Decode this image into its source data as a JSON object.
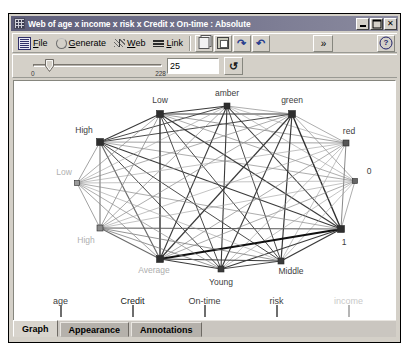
{
  "window": {
    "title": "Web of age x income x risk x Credit x On-time : Absolute",
    "icon_name": "web-graph-icon",
    "minimize_label": "_",
    "maximize_label": "□",
    "close_label": "✕"
  },
  "toolbar": {
    "menus": [
      {
        "label": "File",
        "mnemonic": "F",
        "icon": "file-icon"
      },
      {
        "label": "Generate",
        "mnemonic": "G",
        "icon": "generate-icon"
      },
      {
        "label": "Web",
        "mnemonic": "W",
        "icon": "web-icon"
      },
      {
        "label": "Link",
        "mnemonic": "L",
        "icon": "link-icon"
      }
    ],
    "buttons": [
      {
        "name": "copy-button",
        "icon": "copy-icon",
        "label": ""
      },
      {
        "name": "paste-button",
        "icon": "paste-icon",
        "label": ""
      },
      {
        "name": "redo-button",
        "icon": "redo-icon",
        "label": "↷"
      },
      {
        "name": "undo-button",
        "icon": "undo-icon",
        "label": "↶"
      }
    ],
    "overflow_label": "»",
    "help_label": "?"
  },
  "slider": {
    "min_label": "0",
    "max_label": "228",
    "value": "25",
    "thumb_position_pct": 11,
    "refresh_label": "↺",
    "refresh_name": "refresh-button"
  },
  "plot": {
    "nodes": [
      {
        "id": "n0",
        "label": "High",
        "x": 86,
        "y": 61,
        "size": 7,
        "color": "#2e2e2e",
        "label_dx": -16,
        "label_dy": -9,
        "label_color": "#3d3d3d",
        "anchor": "middle"
      },
      {
        "id": "n1",
        "label": "Low",
        "x": 146,
        "y": 33,
        "size": 7,
        "color": "#2e2e2e",
        "label_dx": 0,
        "label_dy": -11,
        "label_color": "#3d3d3d",
        "anchor": "middle"
      },
      {
        "id": "n2",
        "label": "amber",
        "x": 213,
        "y": 25,
        "size": 6,
        "color": "#2e2e2e",
        "label_dx": 0,
        "label_dy": -10,
        "label_color": "#3d3d3d",
        "anchor": "middle"
      },
      {
        "id": "n3",
        "label": "green",
        "x": 278,
        "y": 33,
        "size": 7,
        "color": "#2e2e2e",
        "label_dx": 0,
        "label_dy": -11,
        "label_color": "#3d3d3d",
        "anchor": "middle"
      },
      {
        "id": "n4",
        "label": "red",
        "x": 332,
        "y": 62,
        "size": 6,
        "color": "#555555",
        "label_dx": 3,
        "label_dy": -9,
        "label_color": "#3d3d3d",
        "anchor": "middle"
      },
      {
        "id": "n5",
        "label": "0",
        "x": 341,
        "y": 100,
        "size": 5,
        "color": "#666666",
        "label_dx": 14,
        "label_dy": -7,
        "label_color": "#3d3d3d",
        "anchor": "middle"
      },
      {
        "id": "n6",
        "label": "1",
        "x": 327,
        "y": 148,
        "size": 7,
        "color": "#2e2e2e",
        "label_dx": 3,
        "label_dy": 16,
        "label_color": "#3d3d3d",
        "anchor": "middle"
      },
      {
        "id": "n7",
        "label": "Middle",
        "x": 267,
        "y": 180,
        "size": 6,
        "color": "#3b3b3b",
        "label_dx": 10,
        "label_dy": 13,
        "label_color": "#3d3d3d",
        "anchor": "middle"
      },
      {
        "id": "n8",
        "label": "Young",
        "x": 207,
        "y": 188,
        "size": 6,
        "color": "#3b3b3b",
        "label_dx": 0,
        "label_dy": 16,
        "label_color": "#3d3d3d",
        "anchor": "middle"
      },
      {
        "id": "n9",
        "label": "Average",
        "x": 146,
        "y": 178,
        "size": 7,
        "color": "#2e2e2e",
        "label_dx": -6,
        "label_dy": 14,
        "label_color": "#adadad",
        "anchor": "middle"
      },
      {
        "id": "n10",
        "label": "High",
        "x": 86,
        "y": 147,
        "size": 6,
        "color": "#8a8a8a",
        "label_dx": -14,
        "label_dy": 15,
        "label_color": "#b0b0b0",
        "anchor": "middle"
      },
      {
        "id": "n11",
        "label": "Low",
        "x": 63,
        "y": 102,
        "size": 5,
        "color": "#9a9a9a",
        "label_dx": -13,
        "label_dy": -8,
        "label_color": "#b0b0b0",
        "anchor": "middle"
      }
    ],
    "links": [
      {
        "a": "n0",
        "b": "n1",
        "w": 1.1,
        "c": "#3a3a3a"
      },
      {
        "a": "n0",
        "b": "n2",
        "w": 1.0,
        "c": "#4a4a4a"
      },
      {
        "a": "n0",
        "b": "n3",
        "w": 1.0,
        "c": "#4a4a4a"
      },
      {
        "a": "n0",
        "b": "n4",
        "w": 0.7,
        "c": "#7a7a7a"
      },
      {
        "a": "n0",
        "b": "n5",
        "w": 0.7,
        "c": "#8a8a8a"
      },
      {
        "a": "n0",
        "b": "n6",
        "w": 1.1,
        "c": "#3a3a3a"
      },
      {
        "a": "n0",
        "b": "n7",
        "w": 1.0,
        "c": "#4a4a4a"
      },
      {
        "a": "n0",
        "b": "n8",
        "w": 1.0,
        "c": "#4a4a4a"
      },
      {
        "a": "n0",
        "b": "n9",
        "w": 1.2,
        "c": "#6a6a6a"
      },
      {
        "a": "n0",
        "b": "n10",
        "w": 1.1,
        "c": "#7a7a7a"
      },
      {
        "a": "n0",
        "b": "n11",
        "w": 0.8,
        "c": "#8a8a8a"
      },
      {
        "a": "n1",
        "b": "n2",
        "w": 1.2,
        "c": "#3a3a3a"
      },
      {
        "a": "n1",
        "b": "n3",
        "w": 1.2,
        "c": "#3a3a3a"
      },
      {
        "a": "n1",
        "b": "n4",
        "w": 0.7,
        "c": "#7a7a7a"
      },
      {
        "a": "n1",
        "b": "n5",
        "w": 0.7,
        "c": "#8a8a8a"
      },
      {
        "a": "n1",
        "b": "n6",
        "w": 1.2,
        "c": "#3a3a3a"
      },
      {
        "a": "n1",
        "b": "n7",
        "w": 1.0,
        "c": "#4a4a4a"
      },
      {
        "a": "n1",
        "b": "n8",
        "w": 1.0,
        "c": "#4a4a4a"
      },
      {
        "a": "n1",
        "b": "n9",
        "w": 1.4,
        "c": "#2e2e2e"
      },
      {
        "a": "n1",
        "b": "n10",
        "w": 0.8,
        "c": "#8a8a8a"
      },
      {
        "a": "n1",
        "b": "n11",
        "w": 0.7,
        "c": "#8a8a8a"
      },
      {
        "a": "n2",
        "b": "n3",
        "w": 0.7,
        "c": "#8a8a8a"
      },
      {
        "a": "n2",
        "b": "n4",
        "w": 0.6,
        "c": "#9a9a9a"
      },
      {
        "a": "n2",
        "b": "n5",
        "w": 0.6,
        "c": "#9a9a9a"
      },
      {
        "a": "n2",
        "b": "n6",
        "w": 1.1,
        "c": "#3a3a3a"
      },
      {
        "a": "n2",
        "b": "n7",
        "w": 1.0,
        "c": "#4a4a4a"
      },
      {
        "a": "n2",
        "b": "n8",
        "w": 1.1,
        "c": "#3a3a3a"
      },
      {
        "a": "n2",
        "b": "n9",
        "w": 1.1,
        "c": "#3a3a3a"
      },
      {
        "a": "n2",
        "b": "n10",
        "w": 0.7,
        "c": "#8a8a8a"
      },
      {
        "a": "n2",
        "b": "n11",
        "w": 0.6,
        "c": "#9a9a9a"
      },
      {
        "a": "n3",
        "b": "n4",
        "w": 0.7,
        "c": "#8a8a8a"
      },
      {
        "a": "n3",
        "b": "n5",
        "w": 0.7,
        "c": "#8a8a8a"
      },
      {
        "a": "n3",
        "b": "n6",
        "w": 1.4,
        "c": "#2e2e2e"
      },
      {
        "a": "n3",
        "b": "n7",
        "w": 1.2,
        "c": "#3a3a3a"
      },
      {
        "a": "n3",
        "b": "n8",
        "w": 1.1,
        "c": "#3a3a3a"
      },
      {
        "a": "n3",
        "b": "n9",
        "w": 1.2,
        "c": "#3a3a3a"
      },
      {
        "a": "n3",
        "b": "n10",
        "w": 0.7,
        "c": "#8a8a8a"
      },
      {
        "a": "n3",
        "b": "n11",
        "w": 0.7,
        "c": "#8a8a8a"
      },
      {
        "a": "n4",
        "b": "n6",
        "w": 0.8,
        "c": "#6a6a6a"
      },
      {
        "a": "n4",
        "b": "n7",
        "w": 0.6,
        "c": "#9a9a9a"
      },
      {
        "a": "n4",
        "b": "n8",
        "w": 0.6,
        "c": "#9a9a9a"
      },
      {
        "a": "n4",
        "b": "n9",
        "w": 0.7,
        "c": "#8a8a8a"
      },
      {
        "a": "n4",
        "b": "n10",
        "w": 0.6,
        "c": "#9a9a9a"
      },
      {
        "a": "n4",
        "b": "n11",
        "w": 0.6,
        "c": "#9a9a9a"
      },
      {
        "a": "n5",
        "b": "n6",
        "w": 0.7,
        "c": "#8a8a8a"
      },
      {
        "a": "n5",
        "b": "n7",
        "w": 0.6,
        "c": "#9a9a9a"
      },
      {
        "a": "n5",
        "b": "n8",
        "w": 0.6,
        "c": "#9a9a9a"
      },
      {
        "a": "n5",
        "b": "n9",
        "w": 0.7,
        "c": "#8a8a8a"
      },
      {
        "a": "n5",
        "b": "n10",
        "w": 0.6,
        "c": "#9a9a9a"
      },
      {
        "a": "n5",
        "b": "n11",
        "w": 0.6,
        "c": "#9a9a9a"
      },
      {
        "a": "n6",
        "b": "n7",
        "w": 1.2,
        "c": "#3a3a3a"
      },
      {
        "a": "n6",
        "b": "n8",
        "w": 1.1,
        "c": "#3a3a3a"
      },
      {
        "a": "n6",
        "b": "n9",
        "w": 2.1,
        "c": "#101010"
      },
      {
        "a": "n6",
        "b": "n10",
        "w": 1.0,
        "c": "#5a5a5a"
      },
      {
        "a": "n6",
        "b": "n11",
        "w": 0.7,
        "c": "#8a8a8a"
      },
      {
        "a": "n7",
        "b": "n8",
        "w": 1.0,
        "c": "#4a4a4a"
      },
      {
        "a": "n7",
        "b": "n9",
        "w": 1.1,
        "c": "#3a3a3a"
      },
      {
        "a": "n7",
        "b": "n10",
        "w": 0.8,
        "c": "#7a7a7a"
      },
      {
        "a": "n7",
        "b": "n11",
        "w": 0.6,
        "c": "#9a9a9a"
      },
      {
        "a": "n8",
        "b": "n9",
        "w": 1.1,
        "c": "#3a3a3a"
      },
      {
        "a": "n8",
        "b": "n10",
        "w": 0.8,
        "c": "#7a7a7a"
      },
      {
        "a": "n8",
        "b": "n11",
        "w": 0.7,
        "c": "#8a8a8a"
      },
      {
        "a": "n9",
        "b": "n10",
        "w": 1.1,
        "c": "#6a6a6a"
      },
      {
        "a": "n9",
        "b": "n11",
        "w": 0.8,
        "c": "#8a8a8a"
      },
      {
        "a": "n10",
        "b": "n11",
        "w": 0.8,
        "c": "#8a8a8a"
      }
    ]
  },
  "legend": {
    "items": [
      {
        "label": "age",
        "color": "#5b5b5b",
        "name": "legend-item-age"
      },
      {
        "label": "Credit",
        "color": "#2f2f2f",
        "name": "legend-item-credit"
      },
      {
        "label": "On-time",
        "color": "#5b5b5b",
        "name": "legend-item-on-time"
      },
      {
        "label": "risk",
        "color": "#434343",
        "name": "legend-item-risk"
      },
      {
        "label": "income",
        "color": "#c4c4c4",
        "name": "legend-item-income"
      }
    ]
  },
  "tabs": [
    {
      "label": "Graph",
      "active": true
    },
    {
      "label": "Appearance",
      "active": false
    },
    {
      "label": "Annotations",
      "active": false
    }
  ],
  "chart_data": {
    "type": "network",
    "title": "Web of age x income x risk x Credit x On-time : Absolute",
    "variables": [
      "age",
      "income",
      "risk",
      "Credit",
      "On-time"
    ],
    "node_labels": [
      "High",
      "Low",
      "amber",
      "green",
      "red",
      "0",
      "1",
      "Middle",
      "Young",
      "Average",
      "High",
      "Low"
    ],
    "link_threshold": "25",
    "link_threshold_range": [
      0,
      228
    ]
  }
}
